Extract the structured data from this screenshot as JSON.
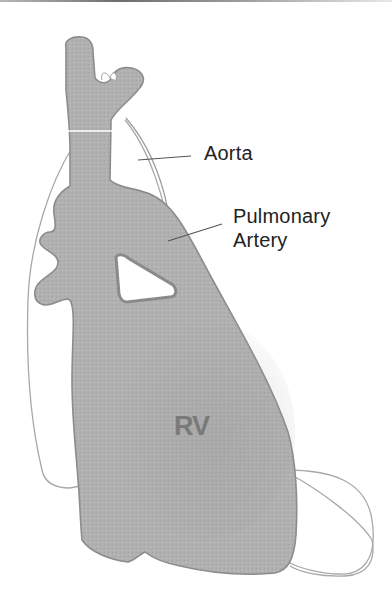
{
  "figure": {
    "labels": {
      "aorta": "Aorta",
      "pulmonary_line1": "Pulmonary",
      "pulmonary_line2": "Artery",
      "chamber": "RV"
    },
    "colors": {
      "fill": "#b3b3b3",
      "fill_dark": "#9e9e9e",
      "stroke": "#8a8a8a",
      "outline": "#a8a8a8",
      "leader": "#666666",
      "text": "#222222"
    }
  }
}
